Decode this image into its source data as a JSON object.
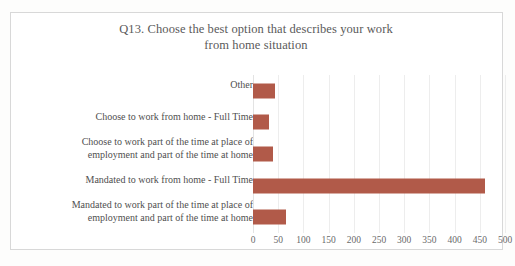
{
  "chart_data": {
    "type": "bar",
    "orientation": "horizontal",
    "title": "Q13.  Choose the best option that describes your work from home situation",
    "title_line1": "Q13.  Choose the best option that describes your work",
    "title_line2": "from home situation",
    "xlabel": "",
    "ylabel": "",
    "categories": [
      "Other",
      "Choose to work from home - Full Time",
      "Choose to work part of the time at place of employment and part of the time at home",
      "Mandated to work from home - Full Time",
      "Mandated to work part of the time at place of employment and part of the time at home"
    ],
    "category_lines": [
      [
        "Other"
      ],
      [
        "Choose to work from home - Full Time"
      ],
      [
        "Choose to work part of the time at place of",
        "employment and part of the time at home"
      ],
      [
        "Mandated to work from home - Full Time"
      ],
      [
        "Mandated to work part of the time at place of",
        "employment and part of the time at home"
      ]
    ],
    "values": [
      44,
      32,
      39,
      460,
      66
    ],
    "xlim": [
      0,
      500
    ],
    "xticks": [
      0,
      50,
      100,
      150,
      200,
      250,
      300,
      350,
      400,
      450,
      500
    ],
    "xtick_labels": [
      "0",
      "50",
      "100",
      "150",
      "200",
      "250",
      "300",
      "350",
      "400",
      "450",
      "500"
    ],
    "grid": true,
    "grid_axis": "x",
    "legend": false,
    "bar_color": "#b15a49",
    "grid_color": "#ededed",
    "text_color": "#4f4f4f",
    "title_color": "#5a5a5a",
    "frame_color": "#d8d8d8",
    "background": "#ffffff"
  }
}
